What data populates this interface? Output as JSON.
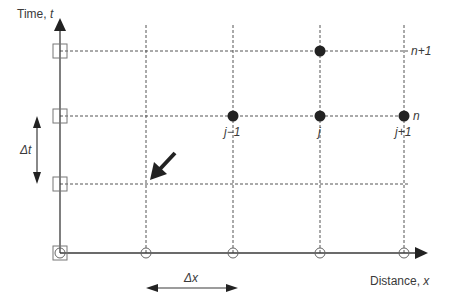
{
  "axes": {
    "y_label": "Time, ",
    "y_var": "t",
    "x_label": "Distance, ",
    "x_var": "x"
  },
  "time_levels": [
    {
      "label": "n+1",
      "y": 51
    },
    {
      "label": "n",
      "y": 116
    },
    {
      "label": "",
      "y": 184
    }
  ],
  "space_nodes": [
    {
      "label": "",
      "x": 146
    },
    {
      "label": "j−1",
      "x": 233
    },
    {
      "label": "j",
      "x": 320
    },
    {
      "label": "j+1",
      "x": 404
    }
  ],
  "labels": {
    "n_plus_1": "n+1",
    "n": "n",
    "j_minus_1": "j−1",
    "j": "j",
    "j_plus_1": "j+1",
    "delta_t": "Δt",
    "delta_x": "Δx"
  },
  "points": {
    "filled": [
      {
        "node": "j",
        "level": "n+1"
      },
      {
        "node": "j-1",
        "level": "n"
      },
      {
        "node": "j",
        "level": "n"
      },
      {
        "node": "j+1",
        "level": "n"
      }
    ],
    "boundary_squares_at_t_axis": [
      "n+1",
      "n",
      "lower level",
      "origin"
    ],
    "open_circles_on_x_axis": [
      "origin",
      "node 1",
      "j-1",
      "j",
      "j+1"
    ]
  },
  "colors": {
    "line": "#3a3a3a",
    "dashed": "#555555",
    "filled_point": "#222222",
    "open_marker": "#777777"
  }
}
